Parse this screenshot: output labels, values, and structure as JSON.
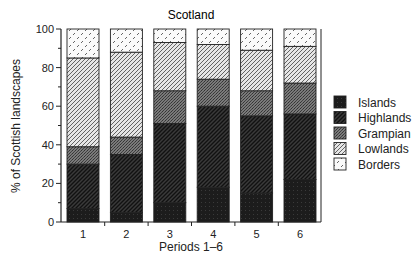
{
  "chart_data": {
    "type": "bar",
    "stacked": true,
    "title": "Scotland",
    "xlabel": "Periods 1–6",
    "ylabel": "% of Scottish landscapes",
    "ylim": [
      0,
      100
    ],
    "yticks": [
      0,
      20,
      40,
      60,
      80,
      100
    ],
    "yminor_ticks": [
      10,
      30,
      50,
      70,
      90
    ],
    "grid": false,
    "legend_position": "right",
    "categories": [
      "1",
      "2",
      "3",
      "4",
      "5",
      "6"
    ],
    "series": [
      {
        "name": "Islands",
        "pattern": "solid-dark",
        "values": [
          7,
          5,
          10,
          18,
          15,
          22
        ]
      },
      {
        "name": "Highlands",
        "pattern": "dense-hatch",
        "values": [
          23,
          30,
          41,
          42,
          40,
          34
        ]
      },
      {
        "name": "Grampian",
        "pattern": "crosshatch",
        "values": [
          9,
          9,
          17,
          14,
          13,
          16
        ]
      },
      {
        "name": "Lowlands",
        "pattern": "light-hatch",
        "values": [
          46,
          44,
          25,
          18,
          21,
          19
        ]
      },
      {
        "name": "Borders",
        "pattern": "dash-dots",
        "values": [
          15,
          12,
          7,
          8,
          11,
          9
        ]
      }
    ]
  },
  "legend": {
    "order": [
      "Islands",
      "Highlands",
      "Grampian",
      "Lowlands",
      "Borders"
    ]
  },
  "colors": {
    "ink": "#1a1a1a",
    "frame": "#222222",
    "background": "#ffffff"
  }
}
